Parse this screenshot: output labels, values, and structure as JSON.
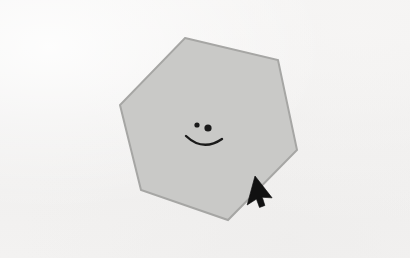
{
  "scene": {
    "title": "Hexagon with smiley face and mouse cursor",
    "background_color": "#f2f1f0",
    "width": 410,
    "height": 258
  },
  "ghost_text": {
    "top_line": "",
    "bottom_line": ""
  },
  "shape": {
    "name": "hexagon",
    "kind": "regular-hexagon",
    "sides": 6,
    "fill_color": "#c9c9c7",
    "stroke_color": "#a6a6a4",
    "stroke_width": 2,
    "rotation_degrees": -8,
    "center_x": 208,
    "center_y": 129,
    "radius": 93,
    "points": "185,38 278,60 297,150 228,220 141,190 120,105"
  },
  "face": {
    "name": "smiley-face",
    "ink_color": "#1a1a1a",
    "left_eye": {
      "cx": 197,
      "cy": 125,
      "r": 2.6
    },
    "right_eye": {
      "cx": 208,
      "cy": 128,
      "r": 3.6
    },
    "mouth": {
      "path": "M 186 136 Q 203 152 222 139",
      "stroke_width": 2.4
    }
  },
  "cursor": {
    "name": "mouse-pointer",
    "color": "#111111",
    "tip_x": 255,
    "tip_y": 176,
    "rotation_degrees": 18,
    "state": "default-arrow"
  }
}
